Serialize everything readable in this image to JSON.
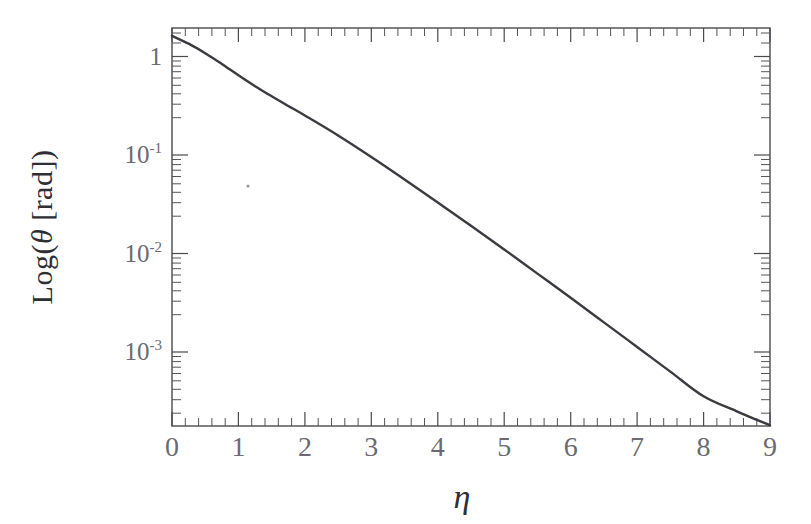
{
  "figure": {
    "background_color": "#ffffff",
    "line_color": "#3a3a40",
    "axis_color": "#4a4a4f",
    "label_color": "#6a6a70"
  },
  "axes": {
    "x_title": "η",
    "y_title_parts": {
      "prefix": "Log(",
      "symbol": "θ",
      "unit": " [rad])"
    },
    "y_title_full": "Log(θ [rad])",
    "x_tick_labels": [
      "0",
      "1",
      "2",
      "3",
      "4",
      "5",
      "6",
      "7",
      "8",
      "9"
    ],
    "y_tick_labels": [
      "1",
      "10⁻¹",
      "10⁻²",
      "10⁻³"
    ],
    "y_tick_mantissas": [
      "1",
      "10",
      "10",
      "10"
    ],
    "y_tick_exponents": [
      "",
      "-1",
      "-2",
      "-3"
    ],
    "x_minor_per_major": 5,
    "y_scale": "log",
    "x_scale": "linear"
  },
  "chart_data": {
    "type": "line",
    "title": "",
    "subtitle": "",
    "xlabel": "η",
    "ylabel": "Log(θ [rad])",
    "xlim": [
      0,
      9
    ],
    "ylim": [
      0.00016,
      2.0
    ],
    "yscale": "log",
    "xscale": "linear",
    "grid": false,
    "legend": null,
    "legend_position": "none",
    "x_ticks": [
      0,
      1,
      2,
      3,
      4,
      5,
      6,
      7,
      8,
      9
    ],
    "y_ticks": [
      1,
      0.1,
      0.01,
      0.001
    ],
    "annotations": [],
    "series": [
      {
        "name": "theta(eta)",
        "x": [
          0,
          0.25,
          0.5,
          0.75,
          1.0,
          1.25,
          1.5,
          1.75,
          2.0,
          2.5,
          3.0,
          3.5,
          4.0,
          4.5,
          5.0,
          5.5,
          6.0,
          6.5,
          7.0,
          7.5,
          8.0,
          8.5,
          9.0
        ],
        "y": [
          1.62,
          1.35,
          1.08,
          0.84,
          0.645,
          0.5,
          0.395,
          0.315,
          0.252,
          0.158,
          0.0955,
          0.0565,
          0.033,
          0.0191,
          0.011,
          0.00625,
          0.00355,
          0.002,
          0.001125,
          0.000632,
          0.000355,
          0.00025,
          0.00018
        ]
      }
    ]
  },
  "artifact": {
    "name": "scan-speck",
    "x": 248,
    "y": 186
  }
}
